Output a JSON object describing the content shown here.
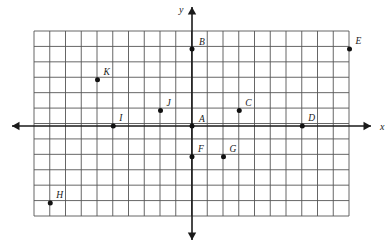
{
  "figure": {
    "name": "coordinate-plane-grid",
    "axis_labels": {
      "x": "x",
      "y": "y"
    },
    "grid": {
      "columns": 20,
      "rows": 12,
      "x_min": -10,
      "x_max": 10,
      "y_min": -6,
      "y_max": 6,
      "cell_width_px": 15.75,
      "cell_height_px": 15.8,
      "origin_px": {
        "x": 192,
        "y": 126
      },
      "left_px": 34,
      "top_px": 31,
      "right_px": 349,
      "bottom_px": 216,
      "grid_color": "#555555",
      "axis_color": "#1a1a1a",
      "point_color": "#111111"
    },
    "points": [
      {
        "label": "A",
        "x": 0,
        "y": 0,
        "label_dx": 7,
        "label_dy": -4
      },
      {
        "label": "B",
        "x": 0,
        "y": 5,
        "label_dx": 7,
        "label_dy": -4
      },
      {
        "label": "C",
        "x": 3,
        "y": 1,
        "label_dx": 6,
        "label_dy": -5
      },
      {
        "label": "D",
        "x": 7,
        "y": 0,
        "label_dx": 6,
        "label_dy": -5
      },
      {
        "label": "E",
        "x": 10,
        "y": 5,
        "label_dx": 6,
        "label_dy": -5
      },
      {
        "label": "F",
        "x": 0,
        "y": -2,
        "label_dx": 6,
        "label_dy": -5
      },
      {
        "label": "G",
        "x": 2,
        "y": -2,
        "label_dx": 6,
        "label_dy": -5
      },
      {
        "label": "H",
        "x": -9,
        "y": -5,
        "label_dx": 6,
        "label_dy": -5
      },
      {
        "label": "I",
        "x": -5,
        "y": 0,
        "label_dx": 6,
        "label_dy": -5
      },
      {
        "label": "J",
        "x": -2,
        "y": 1,
        "label_dx": 6,
        "label_dy": -5
      },
      {
        "label": "K",
        "x": -6,
        "y": 3,
        "label_dx": 6,
        "label_dy": -5
      }
    ]
  },
  "chart_data": {
    "type": "scatter",
    "title": "",
    "xlabel": "x",
    "ylabel": "y",
    "xlim": [
      -10,
      10
    ],
    "ylim": [
      -6,
      6
    ],
    "grid": true,
    "legend": "none",
    "labels": [
      "A",
      "B",
      "C",
      "D",
      "E",
      "F",
      "G",
      "H",
      "I",
      "J",
      "K"
    ],
    "x": [
      0,
      0,
      3,
      7,
      10,
      0,
      2,
      -9,
      -5,
      -2,
      -6
    ],
    "y": [
      0,
      5,
      1,
      0,
      5,
      -2,
      -2,
      -5,
      0,
      1,
      3
    ],
    "annotations": [
      "A at origin (0, 0)",
      "B on y-axis at (0, 5)",
      "C at (3, 1)",
      "D on x-axis at (7, 0)",
      "E at (10, 5) upper right corner of grid",
      "F on y-axis at (0, -2)",
      "G at (2, -2)",
      "H at (-9, -5) lower left",
      "I on x-axis at (-5, 0)",
      "J at (-2, 1)",
      "K at (-6, 3)"
    ]
  }
}
